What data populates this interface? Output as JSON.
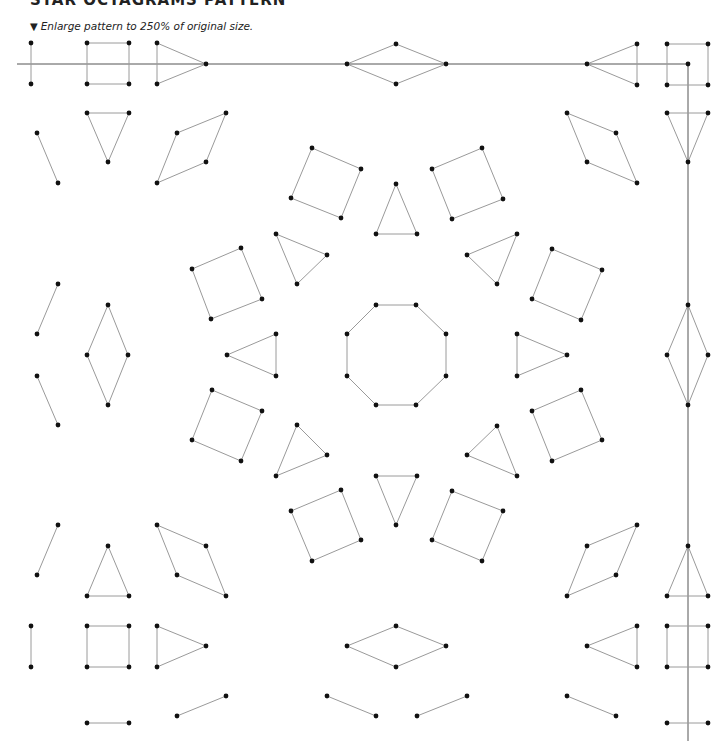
{
  "header": {
    "title": "STAR OCTAGRAMS PATTERN",
    "instruction_marker": "▼",
    "instruction": "Enlarge pattern to 250% of original size."
  },
  "style": {
    "line_color": "#9a9a9a",
    "axis_color": "#555555",
    "dot_color": "#111111"
  },
  "pattern": {
    "axis_lines": [
      {
        "name": "horizontal-axis-line",
        "points": [
          [
            17,
            64
          ],
          [
            688,
            64
          ]
        ]
      },
      {
        "name": "vertical-axis-line",
        "points": [
          [
            688,
            64
          ],
          [
            688,
            741
          ]
        ]
      }
    ],
    "shapes": [
      {
        "name": "segment",
        "closed": false,
        "points": [
          [
            31,
            43
          ],
          [
            31,
            84
          ]
        ]
      },
      {
        "name": "square",
        "closed": true,
        "points": [
          [
            87,
            43
          ],
          [
            129,
            43
          ],
          [
            129,
            84
          ],
          [
            87,
            84
          ]
        ]
      },
      {
        "name": "triangle",
        "closed": true,
        "points": [
          [
            157,
            43
          ],
          [
            206,
            64
          ],
          [
            157,
            84
          ]
        ]
      },
      {
        "name": "diamond",
        "closed": true,
        "points": [
          [
            396,
            44
          ],
          [
            446,
            64
          ],
          [
            396,
            84
          ],
          [
            347,
            64
          ]
        ]
      },
      {
        "name": "triangle",
        "closed": true,
        "points": [
          [
            637,
            44
          ],
          [
            587,
            64
          ],
          [
            637,
            85
          ]
        ]
      },
      {
        "name": "square",
        "closed": true,
        "points": [
          [
            667,
            44
          ],
          [
            708,
            44
          ],
          [
            708,
            85
          ],
          [
            667,
            85
          ]
        ]
      },
      {
        "name": "segment",
        "closed": false,
        "points": [
          [
            37,
            133
          ],
          [
            58,
            183
          ]
        ]
      },
      {
        "name": "triangle",
        "closed": true,
        "points": [
          [
            87,
            113
          ],
          [
            129,
            113
          ],
          [
            108,
            162
          ]
        ]
      },
      {
        "name": "parallelogram",
        "closed": true,
        "points": [
          [
            177,
            133
          ],
          [
            226,
            113
          ],
          [
            206,
            162
          ],
          [
            157,
            183
          ]
        ]
      },
      {
        "name": "parallelogram",
        "closed": true,
        "points": [
          [
            567,
            113
          ],
          [
            616,
            133
          ],
          [
            637,
            183
          ],
          [
            587,
            162
          ]
        ]
      },
      {
        "name": "triangle",
        "closed": true,
        "points": [
          [
            667,
            113
          ],
          [
            708,
            113
          ],
          [
            688,
            162
          ]
        ]
      },
      {
        "name": "square",
        "closed": true,
        "points": [
          [
            312,
            148
          ],
          [
            361,
            169
          ],
          [
            341,
            218
          ],
          [
            291,
            198
          ]
        ]
      },
      {
        "name": "triangle",
        "closed": true,
        "points": [
          [
            396,
            184
          ],
          [
            376,
            234
          ],
          [
            417,
            234
          ]
        ]
      },
      {
        "name": "square",
        "closed": true,
        "points": [
          [
            432,
            169
          ],
          [
            482,
            148
          ],
          [
            503,
            199
          ],
          [
            452,
            219
          ]
        ]
      },
      {
        "name": "triangle",
        "closed": true,
        "points": [
          [
            276,
            234
          ],
          [
            327,
            255
          ],
          [
            297,
            284
          ]
        ]
      },
      {
        "name": "triangle",
        "closed": true,
        "points": [
          [
            467,
            255
          ],
          [
            517,
            234
          ],
          [
            497,
            284
          ]
        ]
      },
      {
        "name": "square",
        "closed": true,
        "points": [
          [
            192,
            269
          ],
          [
            241,
            248
          ],
          [
            262,
            299
          ],
          [
            211,
            319
          ]
        ]
      },
      {
        "name": "square",
        "closed": true,
        "points": [
          [
            552,
            249
          ],
          [
            602,
            270
          ],
          [
            581,
            320
          ],
          [
            532,
            299
          ]
        ]
      },
      {
        "name": "segment",
        "closed": false,
        "points": [
          [
            58,
            284
          ],
          [
            37,
            334
          ]
        ]
      },
      {
        "name": "diamond",
        "closed": true,
        "points": [
          [
            108,
            305
          ],
          [
            128,
            355
          ],
          [
            108,
            405
          ],
          [
            87,
            355
          ]
        ]
      },
      {
        "name": "segment",
        "closed": false,
        "points": [
          [
            37,
            376
          ],
          [
            58,
            425
          ]
        ]
      },
      {
        "name": "triangle",
        "closed": true,
        "points": [
          [
            227,
            355
          ],
          [
            276,
            334
          ],
          [
            276,
            376
          ]
        ]
      },
      {
        "name": "octagon",
        "closed": true,
        "points": [
          [
            376,
            305
          ],
          [
            416,
            305
          ],
          [
            446,
            334
          ],
          [
            446,
            376
          ],
          [
            416,
            405
          ],
          [
            376,
            405
          ],
          [
            347,
            376
          ],
          [
            347,
            334
          ]
        ]
      },
      {
        "name": "triangle",
        "closed": true,
        "points": [
          [
            517,
            334
          ],
          [
            567,
            355
          ],
          [
            517,
            376
          ]
        ]
      },
      {
        "name": "diamond",
        "closed": true,
        "points": [
          [
            688,
            305
          ],
          [
            708,
            355
          ],
          [
            688,
            405
          ],
          [
            667,
            355
          ]
        ]
      },
      {
        "name": "square",
        "closed": true,
        "points": [
          [
            212,
            390
          ],
          [
            262,
            411
          ],
          [
            241,
            461
          ],
          [
            192,
            440
          ]
        ]
      },
      {
        "name": "square",
        "closed": true,
        "points": [
          [
            532,
            411
          ],
          [
            581,
            390
          ],
          [
            602,
            440
          ],
          [
            552,
            461
          ]
        ]
      },
      {
        "name": "triangle",
        "closed": true,
        "points": [
          [
            297,
            425
          ],
          [
            327,
            455
          ],
          [
            276,
            476
          ]
        ]
      },
      {
        "name": "triangle",
        "closed": true,
        "points": [
          [
            497,
            426
          ],
          [
            517,
            476
          ],
          [
            467,
            455
          ]
        ]
      },
      {
        "name": "triangle",
        "closed": true,
        "points": [
          [
            376,
            476
          ],
          [
            417,
            476
          ],
          [
            396,
            525
          ]
        ]
      },
      {
        "name": "square",
        "closed": true,
        "points": [
          [
            291,
            511
          ],
          [
            341,
            490
          ],
          [
            361,
            540
          ],
          [
            312,
            561
          ]
        ]
      },
      {
        "name": "square",
        "closed": true,
        "points": [
          [
            452,
            491
          ],
          [
            503,
            511
          ],
          [
            482,
            561
          ],
          [
            432,
            540
          ]
        ]
      },
      {
        "name": "segment",
        "closed": false,
        "points": [
          [
            58,
            525
          ],
          [
            37,
            575
          ]
        ]
      },
      {
        "name": "triangle",
        "closed": true,
        "points": [
          [
            108,
            546
          ],
          [
            87,
            596
          ],
          [
            129,
            596
          ]
        ]
      },
      {
        "name": "parallelogram",
        "closed": true,
        "points": [
          [
            157,
            525
          ],
          [
            206,
            546
          ],
          [
            226,
            596
          ],
          [
            177,
            575
          ]
        ]
      },
      {
        "name": "parallelogram",
        "closed": true,
        "points": [
          [
            587,
            546
          ],
          [
            637,
            525
          ],
          [
            616,
            575
          ],
          [
            567,
            596
          ]
        ]
      },
      {
        "name": "triangle",
        "closed": true,
        "points": [
          [
            688,
            546
          ],
          [
            667,
            596
          ],
          [
            708,
            596
          ]
        ]
      },
      {
        "name": "segment",
        "closed": false,
        "points": [
          [
            31,
            626
          ],
          [
            31,
            667
          ]
        ]
      },
      {
        "name": "square",
        "closed": true,
        "points": [
          [
            87,
            626
          ],
          [
            129,
            626
          ],
          [
            129,
            667
          ],
          [
            87,
            667
          ]
        ]
      },
      {
        "name": "triangle",
        "closed": true,
        "points": [
          [
            157,
            626
          ],
          [
            206,
            646
          ],
          [
            157,
            667
          ]
        ]
      },
      {
        "name": "diamond",
        "closed": true,
        "points": [
          [
            396,
            626
          ],
          [
            446,
            646
          ],
          [
            396,
            667
          ],
          [
            347,
            646
          ]
        ]
      },
      {
        "name": "triangle",
        "closed": true,
        "points": [
          [
            637,
            626
          ],
          [
            587,
            646
          ],
          [
            637,
            667
          ]
        ]
      },
      {
        "name": "square",
        "closed": true,
        "points": [
          [
            667,
            626
          ],
          [
            708,
            626
          ],
          [
            708,
            667
          ],
          [
            667,
            667
          ]
        ]
      },
      {
        "name": "segment",
        "closed": false,
        "points": [
          [
            87,
            723
          ],
          [
            129,
            723
          ]
        ]
      },
      {
        "name": "segment",
        "closed": false,
        "points": [
          [
            177,
            716
          ],
          [
            226,
            696
          ]
        ]
      },
      {
        "name": "segment",
        "closed": false,
        "points": [
          [
            327,
            696
          ],
          [
            376,
            716
          ]
        ]
      },
      {
        "name": "segment",
        "closed": false,
        "points": [
          [
            417,
            716
          ],
          [
            467,
            696
          ]
        ]
      },
      {
        "name": "segment",
        "closed": false,
        "points": [
          [
            567,
            696
          ],
          [
            616,
            716
          ]
        ]
      },
      {
        "name": "segment",
        "closed": false,
        "points": [
          [
            667,
            723
          ],
          [
            708,
            723
          ]
        ]
      }
    ],
    "extra_dots": [
      [
        688,
        64
      ]
    ]
  }
}
